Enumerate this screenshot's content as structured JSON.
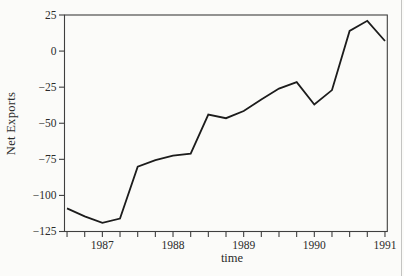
{
  "figure": {
    "ylabel": "Net Exports",
    "xlabel": "time",
    "background": "#fbfbf9",
    "axis_color": "#3f3f3f",
    "line_color": "#1c1c1c"
  },
  "chart_data": {
    "type": "line",
    "title": "",
    "xlabel": "time",
    "ylabel": "Net Exports",
    "series_name": "Net Exports",
    "x": [
      1986.5,
      1986.75,
      1987.0,
      1987.25,
      1987.5,
      1987.75,
      1988.0,
      1988.25,
      1988.5,
      1988.75,
      1989.0,
      1989.25,
      1989.5,
      1989.75,
      1990.0,
      1990.25,
      1990.5,
      1990.75,
      1991.0
    ],
    "x_periods": [
      "1986Q3",
      "1986Q4",
      "1987Q1",
      "1987Q2",
      "1987Q3",
      "1987Q4",
      "1988Q1",
      "1988Q2",
      "1988Q3",
      "1988Q4",
      "1989Q1",
      "1989Q2",
      "1989Q3",
      "1989Q4",
      "1990Q1",
      "1990Q2",
      "1990Q3",
      "1990Q4",
      "1991Q1"
    ],
    "values": [
      -109,
      -114.5,
      -119,
      -116,
      -80,
      -75.5,
      -72.5,
      -71,
      -44,
      -46.5,
      -41.5,
      -33.5,
      -26,
      -21.5,
      -37,
      -27,
      14,
      21,
      7
    ],
    "xlim": [
      1986.464,
      1991.033
    ],
    "ylim": [
      -125,
      25
    ],
    "ytick_values": [
      25,
      0,
      -25,
      -50,
      -75,
      -100,
      -125
    ],
    "ytick_labels": [
      "25",
      "0",
      "−25",
      "−50",
      "−75",
      "−100",
      "−125"
    ],
    "xtick_values": [
      1987,
      1988,
      1989,
      1990,
      1991
    ],
    "xtick_labels": [
      "1987",
      "1988",
      "1989",
      "1990",
      "1991"
    ],
    "xtick_minor_step": 0.25,
    "grid": false,
    "legend_position": "none"
  }
}
